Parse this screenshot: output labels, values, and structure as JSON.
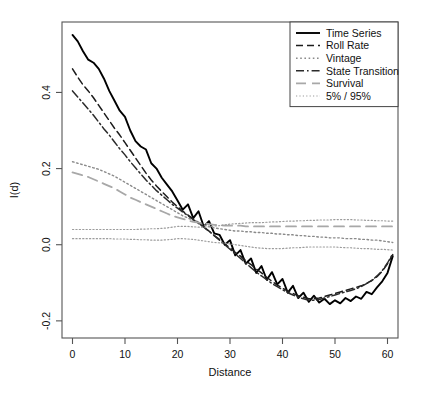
{
  "figure": {
    "background": "#ffffff",
    "frame_color": "#555555",
    "width": 435,
    "height": 395
  },
  "chart_data": {
    "type": "line",
    "title": "",
    "xlabel": "Distance",
    "ylabel": "I(d)",
    "xlim": [
      -2,
      62
    ],
    "ylim": [
      -0.245,
      0.585
    ],
    "xticks": [
      0,
      10,
      20,
      30,
      40,
      50,
      60
    ],
    "xtick_labels": [
      "0",
      "10",
      "20",
      "30",
      "40",
      "50",
      "60"
    ],
    "yticks": [
      -0.2,
      0.0,
      0.2,
      0.4
    ],
    "ytick_labels": [
      "-0.2",
      "0.0",
      "0.2",
      "0.4"
    ],
    "grid": false,
    "legend_position": "top-right",
    "x": [
      0,
      1,
      2,
      3,
      4,
      5,
      6,
      7,
      8,
      9,
      10,
      11,
      12,
      13,
      14,
      15,
      16,
      17,
      18,
      19,
      20,
      21,
      22,
      23,
      24,
      25,
      26,
      27,
      28,
      29,
      30,
      31,
      32,
      33,
      34,
      35,
      36,
      37,
      38,
      39,
      40,
      41,
      42,
      43,
      44,
      45,
      46,
      47,
      48,
      49,
      50,
      51,
      52,
      53,
      54,
      55,
      56,
      57,
      58,
      59,
      60,
      61
    ],
    "series": [
      {
        "name": "Time Series",
        "style": "solid",
        "color": "#000000",
        "width": 1.9,
        "values": [
          0.551,
          0.534,
          0.508,
          0.486,
          0.478,
          0.462,
          0.436,
          0.404,
          0.378,
          0.352,
          0.336,
          0.3,
          0.272,
          0.258,
          0.25,
          0.214,
          0.2,
          0.176,
          0.158,
          0.14,
          0.116,
          0.092,
          0.106,
          0.07,
          0.088,
          0.048,
          0.062,
          0.03,
          0.026,
          0.0,
          0.012,
          -0.028,
          -0.014,
          -0.05,
          -0.036,
          -0.074,
          -0.056,
          -0.092,
          -0.072,
          -0.104,
          -0.09,
          -0.126,
          -0.108,
          -0.14,
          -0.126,
          -0.15,
          -0.134,
          -0.152,
          -0.142,
          -0.156,
          -0.146,
          -0.154,
          -0.14,
          -0.148,
          -0.136,
          -0.142,
          -0.124,
          -0.13,
          -0.112,
          -0.096,
          -0.074,
          -0.03
        ]
      },
      {
        "name": "Roll Rate",
        "style": "dashed",
        "color": "#1c1c1c",
        "width": 1.5,
        "values": [
          0.462,
          0.44,
          0.42,
          0.404,
          0.386,
          0.366,
          0.346,
          0.326,
          0.306,
          0.288,
          0.268,
          0.248,
          0.228,
          0.208,
          0.188,
          0.17,
          0.154,
          0.14,
          0.126,
          0.112,
          0.1,
          0.088,
          0.078,
          0.068,
          0.058,
          0.046,
          0.036,
          0.024,
          0.014,
          0.002,
          -0.008,
          -0.02,
          -0.03,
          -0.042,
          -0.052,
          -0.064,
          -0.074,
          -0.086,
          -0.096,
          -0.106,
          -0.114,
          -0.122,
          -0.128,
          -0.134,
          -0.138,
          -0.142,
          -0.142,
          -0.14,
          -0.136,
          -0.132,
          -0.128,
          -0.124,
          -0.12,
          -0.116,
          -0.112,
          -0.108,
          -0.102,
          -0.094,
          -0.084,
          -0.07,
          -0.05,
          -0.026
        ]
      },
      {
        "name": "Vintage",
        "style": "dotted",
        "color": "#8a8a8a",
        "width": 1.4,
        "values": [
          0.218,
          0.214,
          0.21,
          0.206,
          0.202,
          0.198,
          0.192,
          0.186,
          0.18,
          0.172,
          0.164,
          0.156,
          0.148,
          0.14,
          0.132,
          0.124,
          0.116,
          0.108,
          0.1,
          0.092,
          0.084,
          0.076,
          0.07,
          0.064,
          0.058,
          0.052,
          0.048,
          0.044,
          0.042,
          0.04,
          0.038,
          0.036,
          0.036,
          0.034,
          0.034,
          0.032,
          0.032,
          0.03,
          0.03,
          0.028,
          0.028,
          0.026,
          0.026,
          0.024,
          0.024,
          0.022,
          0.022,
          0.02,
          0.02,
          0.018,
          0.018,
          0.018,
          0.016,
          0.016,
          0.016,
          0.014,
          0.014,
          0.012,
          0.012,
          0.01,
          0.008,
          0.006
        ]
      },
      {
        "name": "State Transition",
        "style": "dashdot",
        "color": "#2b2b2b",
        "width": 1.5,
        "values": [
          0.404,
          0.388,
          0.372,
          0.356,
          0.34,
          0.322,
          0.304,
          0.288,
          0.27,
          0.252,
          0.236,
          0.218,
          0.202,
          0.186,
          0.17,
          0.156,
          0.142,
          0.13,
          0.118,
          0.106,
          0.096,
          0.086,
          0.076,
          0.066,
          0.056,
          0.046,
          0.036,
          0.024,
          0.012,
          0.0,
          -0.012,
          -0.024,
          -0.036,
          -0.048,
          -0.06,
          -0.072,
          -0.082,
          -0.092,
          -0.102,
          -0.11,
          -0.118,
          -0.126,
          -0.132,
          -0.138,
          -0.142,
          -0.146,
          -0.146,
          -0.144,
          -0.14,
          -0.136,
          -0.132,
          -0.128,
          -0.124,
          -0.12,
          -0.116,
          -0.11,
          -0.102,
          -0.094,
          -0.082,
          -0.068,
          -0.048,
          -0.024
        ]
      },
      {
        "name": "Survival",
        "style": "longdash",
        "color": "#a8a8a8",
        "width": 1.8,
        "values": [
          0.19,
          0.186,
          0.182,
          0.178,
          0.172,
          0.166,
          0.16,
          0.154,
          0.148,
          0.14,
          0.132,
          0.124,
          0.118,
          0.112,
          0.106,
          0.1,
          0.094,
          0.088,
          0.082,
          0.076,
          0.072,
          0.068,
          0.064,
          0.06,
          0.058,
          0.056,
          0.054,
          0.052,
          0.052,
          0.05,
          0.05,
          0.05,
          0.05,
          0.048,
          0.048,
          0.048,
          0.048,
          0.048,
          0.048,
          0.048,
          0.048,
          0.048,
          0.048,
          0.048,
          0.048,
          0.048,
          0.048,
          0.048,
          0.048,
          0.048,
          0.048,
          0.048,
          0.048,
          0.048,
          0.048,
          0.048,
          0.048,
          0.048,
          0.048,
          0.048,
          0.048,
          0.048
        ]
      },
      {
        "name": "5% / 95%",
        "style": "finedot",
        "color": "#9c9c9c",
        "width": 1.2,
        "band": "upper",
        "values": [
          0.04,
          0.04,
          0.04,
          0.04,
          0.04,
          0.04,
          0.04,
          0.04,
          0.04,
          0.04,
          0.04,
          0.04,
          0.04,
          0.041,
          0.041,
          0.042,
          0.042,
          0.043,
          0.044,
          0.046,
          0.048,
          0.048,
          0.048,
          0.047,
          0.046,
          0.046,
          0.047,
          0.049,
          0.05,
          0.052,
          0.054,
          0.055,
          0.056,
          0.057,
          0.058,
          0.058,
          0.058,
          0.059,
          0.06,
          0.06,
          0.061,
          0.062,
          0.062,
          0.063,
          0.063,
          0.064,
          0.064,
          0.065,
          0.065,
          0.065,
          0.066,
          0.066,
          0.066,
          0.066,
          0.065,
          0.065,
          0.064,
          0.064,
          0.063,
          0.063,
          0.062,
          0.062
        ]
      },
      {
        "name": "5% / 95%",
        "style": "finedot",
        "color": "#9c9c9c",
        "width": 1.2,
        "band": "lower",
        "values": [
          0.016,
          0.016,
          0.016,
          0.016,
          0.016,
          0.016,
          0.016,
          0.016,
          0.015,
          0.015,
          0.015,
          0.014,
          0.014,
          0.013,
          0.013,
          0.012,
          0.012,
          0.012,
          0.013,
          0.014,
          0.016,
          0.016,
          0.015,
          0.014,
          0.012,
          0.01,
          0.008,
          0.006,
          0.005,
          0.004,
          0.002,
          0.0,
          -0.002,
          -0.004,
          -0.006,
          -0.008,
          -0.009,
          -0.01,
          -0.01,
          -0.01,
          -0.01,
          -0.009,
          -0.008,
          -0.008,
          -0.007,
          -0.006,
          -0.006,
          -0.006,
          -0.006,
          -0.006,
          -0.006,
          -0.007,
          -0.008,
          -0.008,
          -0.009,
          -0.01,
          -0.01,
          -0.011,
          -0.012,
          -0.012,
          -0.013,
          -0.014
        ]
      }
    ]
  },
  "legend": {
    "items": [
      {
        "label": "Time Series",
        "style": "solid"
      },
      {
        "label": "Roll Rate",
        "style": "dashed"
      },
      {
        "label": "Vintage",
        "style": "dotted"
      },
      {
        "label": "State Transition",
        "style": "dashdot"
      },
      {
        "label": "Survival",
        "style": "longdash"
      },
      {
        "label": "5% / 95%",
        "style": "finedot"
      }
    ]
  }
}
